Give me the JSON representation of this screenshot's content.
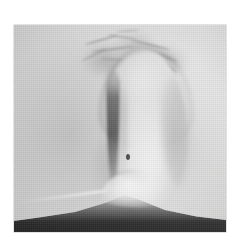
{
  "page": {
    "background_color": "#ffffff",
    "width": 239,
    "height": 244
  },
  "figure": {
    "name": "halftone-photograph",
    "media": "black-and-white halftone-screened photographic reproduction",
    "caption": "",
    "plate": {
      "left": 14,
      "top": 25,
      "width": 212,
      "height": 207,
      "border_color": "#969696"
    },
    "palette": {
      "paper": "#ffffff",
      "background_light": "#cacaca",
      "background_mid": "#b9b9b9",
      "background_dark": "#a0a0a0",
      "subject_highlight": "#d6d6d6",
      "subject_midtone": "#b4b4b4",
      "crease_dark": "#2a2a2a",
      "hair_dark": "#3a3a3a",
      "shoulder_black": "#0a0a0a",
      "neck_highlight": "#fafafa"
    },
    "regions": [
      {
        "id": "background",
        "label": "plain studio backdrop",
        "tone": "light grey"
      },
      {
        "id": "hair-mass",
        "label": "wispy hair strands across crown",
        "tone": "dark grey"
      },
      {
        "id": "subject-head",
        "label": "blurred oval head form",
        "tone": "mid grey"
      },
      {
        "id": "subject-arch",
        "label": "dark arch outlining crown",
        "tone": "dark grey"
      },
      {
        "id": "left-crease",
        "label": "long dark crescent at left of face",
        "tone": "near black"
      },
      {
        "id": "right-shadow",
        "label": "soft shadow right of face",
        "tone": "mid grey"
      },
      {
        "id": "dark-speck",
        "label": "small dark blemish",
        "tone": "black"
      },
      {
        "id": "neck-highlight",
        "label": "bright neck and collar",
        "tone": "white"
      },
      {
        "id": "shoulder-band",
        "label": "dark garment across shoulders",
        "tone": "black"
      }
    ],
    "artefacts": {
      "halftone_screen": true,
      "film_grain": true,
      "vignette": true,
      "blur": "heavy — subject is out of focus"
    }
  }
}
